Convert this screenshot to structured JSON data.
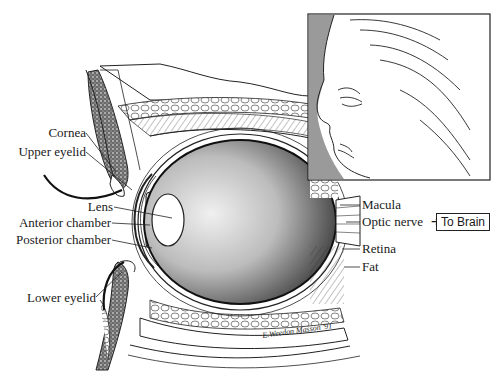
{
  "labels_left": [
    {
      "id": "cornea",
      "text": "Cornea"
    },
    {
      "id": "upper-eyelid",
      "text": "Upper eyelid"
    },
    {
      "id": "lens",
      "text": "Lens"
    },
    {
      "id": "anterior-chamber",
      "text": "Anterior chamber"
    },
    {
      "id": "posterior-chamber",
      "text": "Posterior chamber"
    },
    {
      "id": "lower-eyelid",
      "text": "Lower eyelid"
    }
  ],
  "labels_right": [
    {
      "id": "macula",
      "text": "Macula"
    },
    {
      "id": "optic-nerve",
      "text": "Optic nerve"
    },
    {
      "id": "retina",
      "text": "Retina"
    },
    {
      "id": "fat",
      "text": "Fat"
    }
  ],
  "callout": {
    "arrow": "➔",
    "text": "To Brain"
  },
  "inset": {
    "description": "Profile of an elderly woman's face"
  },
  "signature": {
    "artist": "E.Weedon Masson",
    "year": "'91"
  },
  "colors": {
    "ink": "#1a1a1a",
    "stipple": "#555555",
    "inset_shadow": "#9a9a9a",
    "background": "#ffffff"
  }
}
